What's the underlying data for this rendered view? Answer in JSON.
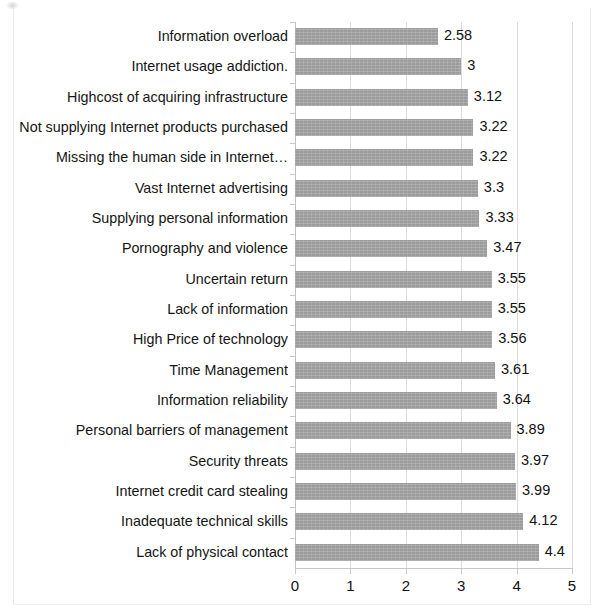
{
  "chart_data": {
    "type": "bar",
    "orientation": "horizontal",
    "title": "",
    "subtitle": "",
    "xlabel": "",
    "ylabel": "",
    "xlim": [
      0,
      5
    ],
    "xticks": [
      "0",
      "1",
      "2",
      "3",
      "4",
      "5"
    ],
    "grid": true,
    "legend": false,
    "bar_color": "#9c9c9c",
    "categories": [
      "Information overload",
      "Internet usage addiction.",
      "Highcost of acquiring infrastructure",
      "Not supplying Internet products purchased",
      "Missing the human side in Internet…",
      "Vast Internet advertising",
      "Supplying personal information",
      "Pornography and violence",
      "Uncertain return",
      "Lack of information",
      "High Price of technology",
      "Time Management",
      "Information reliability",
      "Personal barriers of management",
      "Security threats",
      "Internet credit card stealing",
      "Inadequate technical skills",
      "Lack of physical contact"
    ],
    "values": [
      2.58,
      3,
      3.12,
      3.22,
      3.22,
      3.3,
      3.33,
      3.47,
      3.55,
      3.55,
      3.56,
      3.61,
      3.64,
      3.89,
      3.97,
      3.99,
      4.12,
      4.4
    ],
    "value_labels": [
      "2.58",
      "3",
      "3.12",
      "3.22",
      "3.22",
      "3.3",
      "3.33",
      "3.47",
      "3.55",
      "3.55",
      "3.56",
      "3.61",
      "3.64",
      "3.89",
      "3.97",
      "3.99",
      "4.12",
      "4.4"
    ]
  }
}
